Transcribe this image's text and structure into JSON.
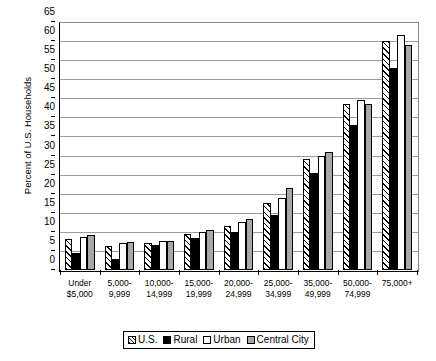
{
  "chart_data": {
    "type": "bar",
    "title": "",
    "xlabel": "",
    "ylabel": "Percent of U.S. Households",
    "ylim": [
      0,
      65
    ],
    "ytick_step": 5,
    "yticks": [
      0,
      5,
      10,
      15,
      20,
      25,
      30,
      35,
      40,
      45,
      50,
      55,
      60,
      65
    ],
    "grid": true,
    "legend_position": "bottom-center",
    "categories": [
      "Under $5,000",
      "5,000-9,999",
      "10,000-14,999",
      "15,000-19,999",
      "20,000-24,999",
      "25,000-34,999",
      "35,000-49,999",
      "50,000-74,999",
      "75,000+"
    ],
    "category_lines": [
      [
        "Under",
        "$5,000"
      ],
      [
        "5,000-",
        "9,999"
      ],
      [
        "10,000-",
        "14,999"
      ],
      [
        "15,000-",
        "19,999"
      ],
      [
        "20,000-",
        "24,999"
      ],
      [
        "25,000-",
        "34,999"
      ],
      [
        "35,000-",
        "49,999"
      ],
      [
        "50,000-",
        "74,999"
      ],
      [
        "75,000+",
        ""
      ]
    ],
    "series": [
      {
        "name": "U.S.",
        "pattern": "diagonal-hatch",
        "color": "#ffffff",
        "values": [
          8.0,
          6.3,
          7.2,
          9.5,
          11.5,
          17.5,
          29.0,
          43.5,
          60.0
        ]
      },
      {
        "name": "Rural",
        "pattern": "solid-black",
        "color": "#000000",
        "values": [
          4.5,
          3.0,
          6.5,
          8.3,
          10.0,
          14.5,
          25.5,
          38.0,
          53.0
        ]
      },
      {
        "name": "Urban",
        "pattern": "solid-white",
        "color": "#ffffff",
        "values": [
          8.7,
          7.0,
          7.5,
          10.0,
          12.5,
          19.0,
          30.0,
          44.5,
          61.5
        ]
      },
      {
        "name": "Central City",
        "pattern": "solid-gray",
        "color": "#a8a8a8",
        "values": [
          9.3,
          7.3,
          7.5,
          10.5,
          13.5,
          21.5,
          31.0,
          43.5,
          59.0
        ]
      }
    ]
  }
}
